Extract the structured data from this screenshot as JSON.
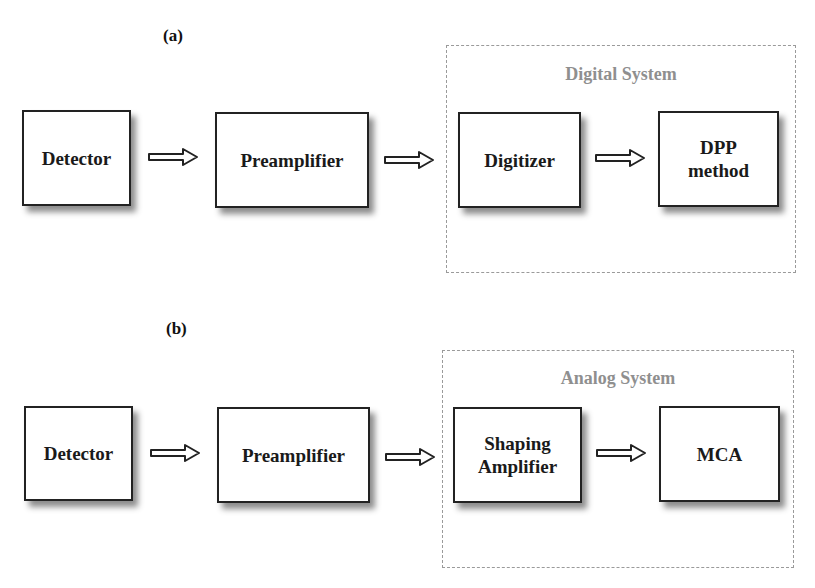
{
  "panels": [
    {
      "label": "(a)",
      "blocks": [
        {
          "id": "detector",
          "text": "Detector"
        },
        {
          "id": "preamplifier",
          "text": "Preamplifier"
        },
        {
          "id": "digitizer",
          "text": "Digitizer"
        },
        {
          "id": "dpp-method",
          "text": "DPP\nmethod",
          "line1": "DPP",
          "line2": "method"
        }
      ],
      "group": {
        "title": "Digital System",
        "contains": [
          "digitizer",
          "dpp-method"
        ]
      },
      "edges": [
        {
          "from": "detector",
          "to": "preamplifier"
        },
        {
          "from": "preamplifier",
          "to": "digitizer"
        },
        {
          "from": "digitizer",
          "to": "dpp-method"
        }
      ]
    },
    {
      "label": "(b)",
      "blocks": [
        {
          "id": "detector",
          "text": "Detector"
        },
        {
          "id": "preamplifier",
          "text": "Preamplifier"
        },
        {
          "id": "shaping-amplifier",
          "text": "Shaping\nAmplifier",
          "line1": "Shaping",
          "line2": "Amplifier"
        },
        {
          "id": "mca",
          "text": "MCA"
        }
      ],
      "group": {
        "title": "Analog System",
        "contains": [
          "shaping-amplifier",
          "mca"
        ]
      },
      "edges": [
        {
          "from": "detector",
          "to": "preamplifier"
        },
        {
          "from": "preamplifier",
          "to": "shaping-amplifier"
        },
        {
          "from": "shaping-amplifier",
          "to": "mca"
        }
      ]
    }
  ],
  "colors": {
    "box_border": "#222222",
    "group_border": "#9a9a9a",
    "group_title": "#8f8f8f",
    "text": "#1a1a1a"
  }
}
